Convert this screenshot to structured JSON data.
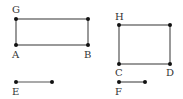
{
  "diagram": {
    "title": "",
    "colors": {
      "line": "#555555",
      "point": "#111111",
      "label": "#333333"
    },
    "rectangles": [
      {
        "id": "rect-left",
        "x": 16,
        "y": 19,
        "width": 72,
        "height": 26,
        "vertices": [
          {
            "label": "G",
            "x": 16,
            "y": 19,
            "lx": 12,
            "ly": 13
          },
          {
            "label": "A",
            "x": 16,
            "y": 45,
            "lx": 12,
            "ly": 58
          },
          {
            "label": "B",
            "x": 88,
            "y": 45,
            "lx": 84,
            "ly": 58
          },
          {
            "label": "",
            "x": 88,
            "y": 19
          }
        ]
      },
      {
        "id": "rect-right",
        "x": 119,
        "y": 25,
        "width": 51,
        "height": 39,
        "vertices": [
          {
            "label": "H",
            "x": 119,
            "y": 25,
            "lx": 115,
            "ly": 20
          },
          {
            "label": "C",
            "x": 119,
            "y": 64,
            "lx": 115,
            "ly": 76
          },
          {
            "label": "D",
            "x": 170,
            "y": 64,
            "lx": 166,
            "ly": 76
          },
          {
            "label": "",
            "x": 170,
            "y": 25
          }
        ]
      }
    ],
    "segments": [
      {
        "id": "seg-e",
        "label": "E",
        "x1": 16,
        "y1": 82,
        "x2": 52,
        "y2": 82,
        "lx": 12,
        "ly": 95
      },
      {
        "id": "seg-f",
        "label": "F",
        "x1": 119,
        "y1": 82,
        "x2": 145,
        "y2": 82,
        "lx": 115,
        "ly": 95
      }
    ]
  }
}
